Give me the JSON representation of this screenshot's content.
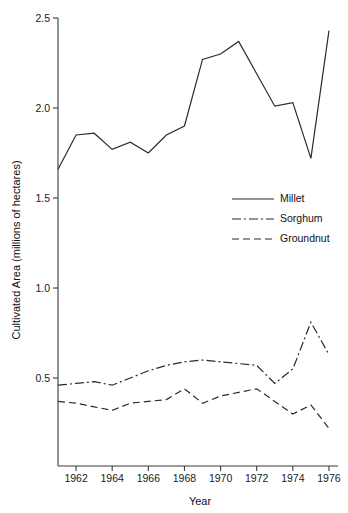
{
  "chart_data": {
    "type": "line",
    "title": "",
    "xlabel": "Year",
    "ylabel": "Cultivated Area (millions of hectares)",
    "xlim": [
      1961,
      1976.5
    ],
    "ylim": [
      0.15,
      2.55
    ],
    "grid": false,
    "legend_position": "middle-right",
    "x": [
      1961,
      1962,
      1963,
      1964,
      1965,
      1966,
      1967,
      1968,
      1969,
      1970,
      1971,
      1972,
      1973,
      1974,
      1975,
      1976
    ],
    "xticks": [
      1962,
      1964,
      1966,
      1968,
      1970,
      1972,
      1974,
      1976
    ],
    "xtick_labels": [
      "1962",
      "1964",
      "1966",
      "1968",
      "1970",
      "1972",
      "1974",
      "1976"
    ],
    "yticks": [
      0.5,
      1.0,
      1.5,
      2.0,
      2.5
    ],
    "ytick_labels": [
      "0.5",
      "1.0",
      "1.5",
      "2.0",
      "2.5"
    ],
    "series": [
      {
        "name": "Millet",
        "style": "solid",
        "values": [
          1.66,
          1.85,
          1.86,
          1.77,
          1.81,
          1.75,
          1.85,
          1.9,
          2.27,
          2.3,
          2.37,
          2.19,
          2.01,
          2.03,
          1.72,
          2.43
        ]
      },
      {
        "name": "Sorghum",
        "style": "dash-dot",
        "values": [
          0.46,
          0.47,
          0.48,
          0.46,
          0.5,
          0.54,
          0.57,
          0.59,
          0.6,
          0.59,
          0.58,
          0.57,
          0.47,
          0.55,
          0.81,
          0.63
        ]
      },
      {
        "name": "Groundnut",
        "style": "dashed",
        "values": [
          0.37,
          0.36,
          0.34,
          0.32,
          0.36,
          0.37,
          0.38,
          0.44,
          0.36,
          0.4,
          0.42,
          0.44,
          0.37,
          0.3,
          0.35,
          0.22
        ]
      }
    ]
  },
  "axes": {
    "y_title": "Cultivated Area (millions of hectares)",
    "x_title": "Year"
  },
  "legend": {
    "entries": [
      {
        "label": "Millet"
      },
      {
        "label": "Sorghum"
      },
      {
        "label": "Groundnut"
      }
    ]
  },
  "ticks": {
    "y": [
      {
        "label": "2.5"
      },
      {
        "label": "2.0"
      },
      {
        "label": "1.5"
      },
      {
        "label": "1.0"
      },
      {
        "label": "0.5"
      }
    ],
    "x": [
      {
        "label": "1962"
      },
      {
        "label": "1964"
      },
      {
        "label": "1966"
      },
      {
        "label": "1968"
      },
      {
        "label": "1970"
      },
      {
        "label": "1972"
      },
      {
        "label": "1974"
      },
      {
        "label": "1976"
      }
    ]
  },
  "colors": {
    "line": "#2b2b2b",
    "axis": "#3a3a3a",
    "text": "#111111",
    "background": "#ffffff"
  }
}
